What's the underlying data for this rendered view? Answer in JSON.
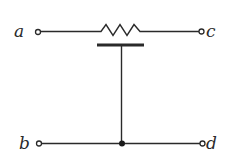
{
  "diagram": {
    "type": "potentiometer-circuit",
    "terminals": [
      {
        "id": "a",
        "label": "a",
        "position": "top-left"
      },
      {
        "id": "c",
        "label": "c",
        "position": "top-right"
      },
      {
        "id": "b",
        "label": "b",
        "position": "bottom-left"
      },
      {
        "id": "d",
        "label": "d",
        "position": "bottom-right"
      }
    ],
    "components": [
      {
        "id": "resistor",
        "kind": "resistor",
        "between": [
          "a",
          "c"
        ]
      },
      {
        "id": "wiper",
        "kind": "sliding-contact",
        "connects_to": "junction"
      },
      {
        "id": "junction",
        "kind": "junction-dot",
        "on_wire": "b-d"
      }
    ],
    "colors": {
      "ink": "#2a2a2a",
      "background": "#ffffff"
    }
  }
}
